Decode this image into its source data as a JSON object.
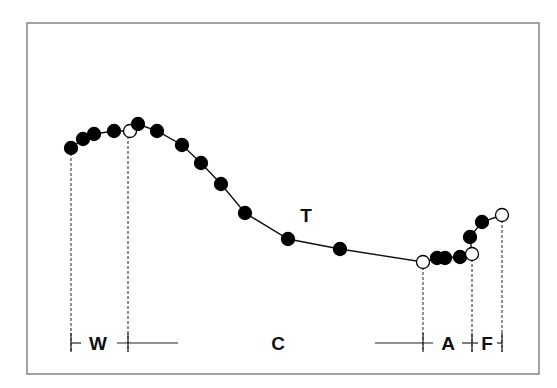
{
  "diagram": {
    "frame": {
      "x": 27,
      "y": 23,
      "w": 512,
      "h": 351,
      "stroke": "#8a8a8a"
    },
    "curve_label": "T",
    "curve_label_pos": [
      306,
      222
    ],
    "points": [
      {
        "x": 71,
        "y": 148,
        "open": false
      },
      {
        "x": 83,
        "y": 139,
        "open": false
      },
      {
        "x": 94,
        "y": 134,
        "open": false
      },
      {
        "x": 114,
        "y": 131,
        "open": false
      },
      {
        "x": 130,
        "y": 131,
        "open": true
      },
      {
        "x": 138,
        "y": 124,
        "open": false
      },
      {
        "x": 157,
        "y": 131,
        "open": false
      },
      {
        "x": 182,
        "y": 145,
        "open": false
      },
      {
        "x": 201,
        "y": 163,
        "open": false
      },
      {
        "x": 221,
        "y": 184,
        "open": false
      },
      {
        "x": 245,
        "y": 213,
        "open": false
      },
      {
        "x": 288,
        "y": 239,
        "open": false
      },
      {
        "x": 340,
        "y": 249,
        "open": false
      },
      {
        "x": 423,
        "y": 262,
        "open": true
      },
      {
        "x": 437,
        "y": 258,
        "open": false
      },
      {
        "x": 445,
        "y": 258,
        "open": false
      },
      {
        "x": 460,
        "y": 257,
        "open": false
      },
      {
        "x": 470,
        "y": 237,
        "open": false
      },
      {
        "x": 482,
        "y": 222,
        "open": false
      },
      {
        "x": 472,
        "y": 254,
        "open": true
      },
      {
        "x": 502,
        "y": 215,
        "open": true
      }
    ],
    "curve_path": [
      [
        71,
        148
      ],
      [
        83,
        139
      ],
      [
        94,
        134
      ],
      [
        114,
        131
      ],
      [
        130,
        131
      ],
      [
        138,
        124
      ],
      [
        157,
        131
      ],
      [
        182,
        145
      ],
      [
        201,
        163
      ],
      [
        221,
        184
      ],
      [
        245,
        213
      ],
      [
        288,
        239
      ],
      [
        340,
        249
      ],
      [
        423,
        262
      ],
      [
        437,
        258
      ],
      [
        460,
        257
      ],
      [
        472,
        254
      ],
      [
        470,
        237
      ],
      [
        482,
        222
      ],
      [
        502,
        215
      ]
    ],
    "dropdown_lines_x": [
      71,
      128,
      423,
      472,
      502
    ],
    "dropdown_top_y": [
      148,
      131,
      262,
      254,
      215
    ],
    "baseline_y": 343,
    "phases": [
      {
        "label": "W",
        "x": 98
      },
      {
        "label": "C",
        "x": 278
      },
      {
        "label": "A",
        "x": 448
      },
      {
        "label": "F",
        "x": 487
      }
    ]
  }
}
